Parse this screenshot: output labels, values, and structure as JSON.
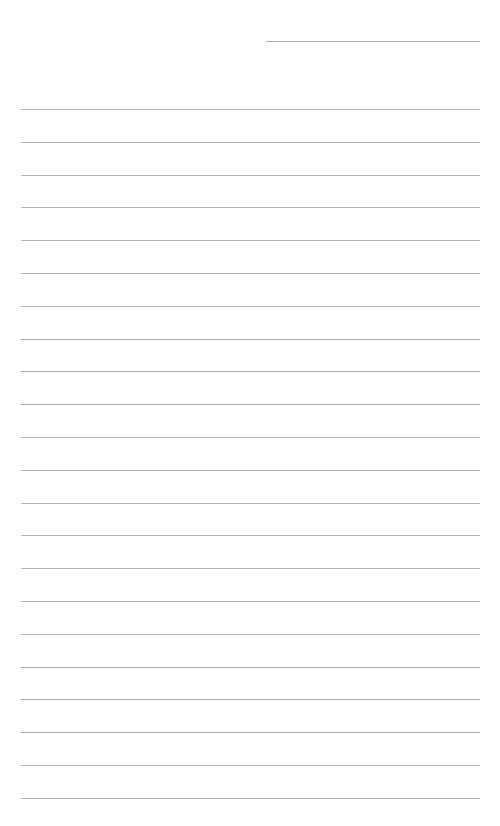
{
  "document": {
    "type": "lined-paper",
    "date_field": "",
    "line_color": "#b4b4b4",
    "background": "#ffffff",
    "lines": [
      {
        "text": ""
      },
      {
        "text": ""
      },
      {
        "text": ""
      },
      {
        "text": ""
      },
      {
        "text": ""
      },
      {
        "text": ""
      },
      {
        "text": ""
      },
      {
        "text": ""
      },
      {
        "text": ""
      },
      {
        "text": ""
      },
      {
        "text": ""
      },
      {
        "text": ""
      },
      {
        "text": ""
      },
      {
        "text": ""
      },
      {
        "text": ""
      },
      {
        "text": ""
      },
      {
        "text": ""
      },
      {
        "text": ""
      },
      {
        "text": ""
      },
      {
        "text": ""
      },
      {
        "text": ""
      },
      {
        "text": ""
      }
    ]
  }
}
